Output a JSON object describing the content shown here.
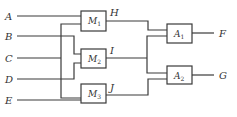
{
  "diagram": {
    "type": "block-circuit",
    "inputs": [
      {
        "id": "A",
        "label": "A",
        "y": 16
      },
      {
        "id": "B",
        "label": "B",
        "y": 36
      },
      {
        "id": "C",
        "label": "C",
        "y": 58
      },
      {
        "id": "D",
        "label": "D",
        "y": 79
      },
      {
        "id": "E",
        "label": "E",
        "y": 100
      }
    ],
    "first_stage": [
      {
        "id": "M1",
        "base": "M",
        "sub": "1",
        "output": "H",
        "inputs": [
          "A",
          "C"
        ]
      },
      {
        "id": "M2",
        "base": "M",
        "sub": "2",
        "output": "I",
        "inputs": [
          "B",
          "D"
        ]
      },
      {
        "id": "M3",
        "base": "M",
        "sub": "3",
        "output": "J",
        "inputs": [
          "C",
          "E"
        ]
      }
    ],
    "intermediate_signals": [
      {
        "id": "H",
        "label": "H"
      },
      {
        "id": "I",
        "label": "I"
      },
      {
        "id": "J",
        "label": "J"
      }
    ],
    "second_stage": [
      {
        "id": "A1",
        "base": "A",
        "sub": "1",
        "output": "F",
        "inputs": [
          "H",
          "I"
        ]
      },
      {
        "id": "A2",
        "base": "A",
        "sub": "2",
        "output": "G",
        "inputs": [
          "I",
          "J"
        ]
      }
    ],
    "outputs": [
      {
        "id": "F",
        "label": "F"
      },
      {
        "id": "G",
        "label": "G"
      }
    ],
    "colors": {
      "line": "#3a3a3a",
      "text": "#333333",
      "background": "#ffffff"
    }
  }
}
